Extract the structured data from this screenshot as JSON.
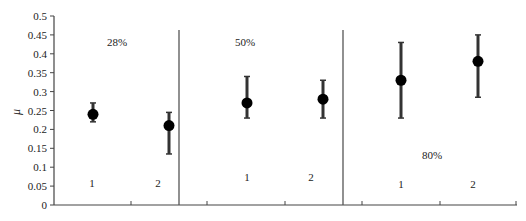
{
  "chart_data": {
    "type": "scatter",
    "title": "",
    "xlabel": "",
    "ylabel": "μ",
    "ylim": [
      0,
      0.5
    ],
    "yticks": [
      "0",
      "0.05",
      "0.1",
      "0.15",
      "0.2",
      "0.25",
      "0.3",
      "0.35",
      "0.4",
      "0.45",
      "0.5"
    ],
    "grid": false,
    "legend": null,
    "groups": [
      {
        "label": "28%",
        "points": [
          {
            "x_label": "1",
            "y": 0.24,
            "err_low": 0.22,
            "err_high": 0.27
          },
          {
            "x_label": "2",
            "y": 0.21,
            "err_low": 0.135,
            "err_high": 0.245
          }
        ]
      },
      {
        "label": "50%",
        "points": [
          {
            "x_label": "1",
            "y": 0.27,
            "err_low": 0.23,
            "err_high": 0.34
          },
          {
            "x_label": "2",
            "y": 0.28,
            "err_low": 0.23,
            "err_high": 0.33
          }
        ]
      },
      {
        "label": "80%",
        "points": [
          {
            "x_label": "1",
            "y": 0.33,
            "err_low": 0.23,
            "err_high": 0.43
          },
          {
            "x_label": "2",
            "y": 0.38,
            "err_low": 0.285,
            "err_high": 0.45
          }
        ]
      }
    ],
    "colors": {
      "marker": "#000000",
      "errorbar": "#333333",
      "axis": "#444444"
    }
  }
}
